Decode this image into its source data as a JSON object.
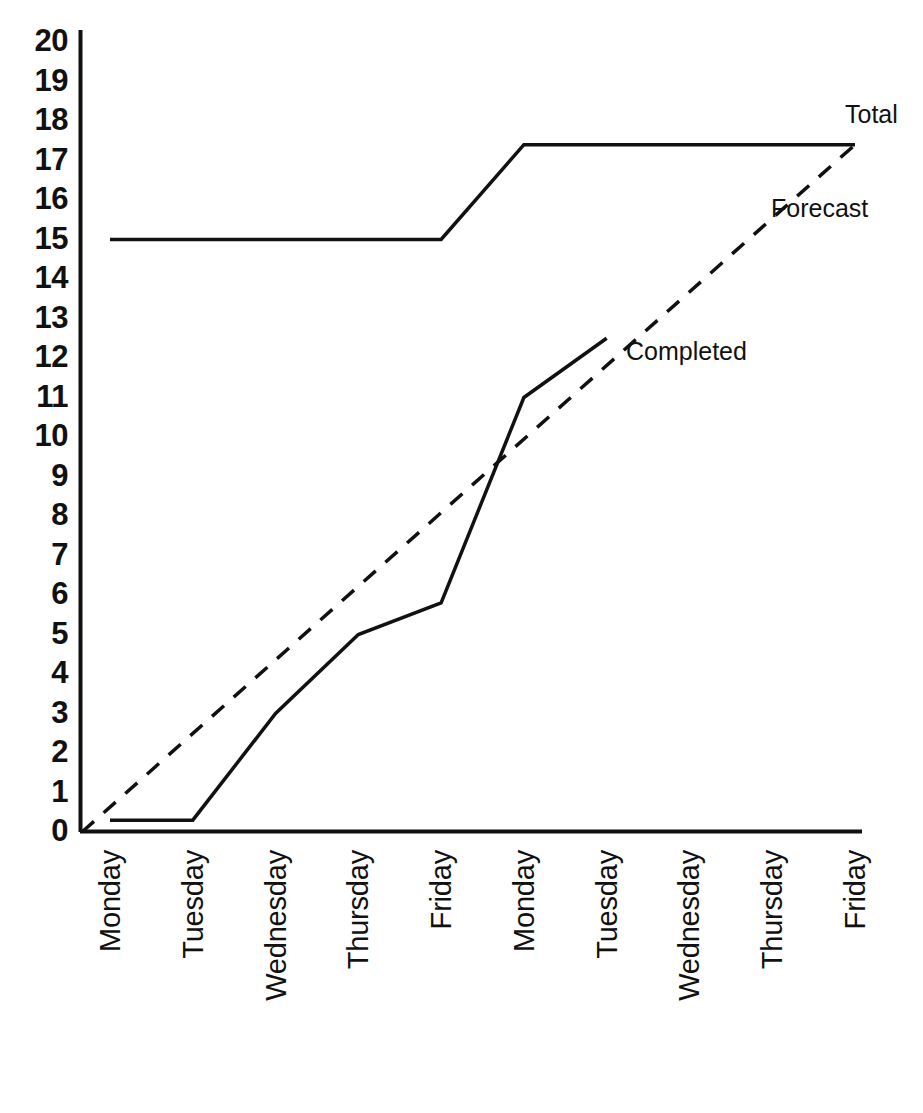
{
  "chart_data": {
    "type": "line",
    "title": "",
    "subtitle": "",
    "xlabel": "",
    "ylabel": "",
    "grid": false,
    "legend_position": "inline-right-of-series",
    "xlim": [
      0,
      9
    ],
    "ylim": [
      0,
      20
    ],
    "y_ticks": [
      "20",
      "19",
      "18",
      "17",
      "16",
      "15",
      "14",
      "13",
      "12",
      "11",
      "10",
      "9",
      "8",
      "7",
      "6",
      "5",
      "4",
      "3",
      "2",
      "1",
      "0"
    ],
    "y_tick_values": [
      20,
      19,
      18,
      17,
      16,
      15,
      14,
      13,
      12,
      11,
      10,
      9,
      8,
      7,
      6,
      5,
      4,
      3,
      2,
      1,
      0
    ],
    "categories": [
      "Monday",
      "Tuesday",
      "Wednesday",
      "Thursday",
      "Friday",
      "Monday",
      "Tuesday",
      "Wednesday",
      "Thursday",
      "Friday"
    ],
    "series": [
      {
        "name": "Total",
        "style": "solid",
        "color": "#111111",
        "values": [
          15,
          15,
          15,
          15,
          15,
          17.4,
          17.4,
          17.4,
          17.4,
          17.4
        ],
        "note": "scope flat at 15 then steps up to 17.4 between Friday (week 1) and Monday (week 2)"
      },
      {
        "name": "Forecast",
        "style": "dashed",
        "color": "#111111",
        "values": [
          0,
          1.93,
          3.87,
          5.8,
          7.73,
          9.67,
          11.6,
          13.53,
          15.47,
          17.4
        ],
        "note": "straight dashed trend line from origin (0) to 17.4 at final Friday"
      },
      {
        "name": "Completed",
        "style": "solid",
        "color": "#111111",
        "values": [
          0.3,
          0.3,
          3.0,
          5.0,
          5.8,
          11.0,
          12.5,
          null,
          null,
          null
        ],
        "note": "actual burn-up; stops after Tuesday of week 2 at 12.5"
      }
    ],
    "annotations": [
      {
        "text": "Total",
        "x_px": 845,
        "y_px": 102
      },
      {
        "text": "Forecast",
        "x_px": 771,
        "y_px": 196
      },
      {
        "text": "Completed",
        "x_px": 626,
        "y_px": 339
      }
    ]
  },
  "labels": {
    "total": "Total",
    "forecast": "Forecast",
    "completed": "Completed"
  },
  "colors": {
    "ink": "#111111",
    "background": "#ffffff"
  }
}
